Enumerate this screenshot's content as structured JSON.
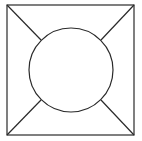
{
  "diagram": {
    "stroke_color": "#2a2a2a",
    "background": "#ffffff",
    "square": {
      "x": 7,
      "y": 5,
      "width": 127,
      "height": 130
    },
    "circle": {
      "cx": 71,
      "cy": 70,
      "r": 42
    },
    "diagonals": [
      {
        "from": [
          7,
          5
        ],
        "to": [
          41,
          40
        ]
      },
      {
        "from": [
          134,
          5
        ],
        "to": [
          101,
          40
        ]
      },
      {
        "from": [
          7,
          135
        ],
        "to": [
          41,
          100
        ]
      },
      {
        "from": [
          134,
          135
        ],
        "to": [
          101,
          100
        ]
      }
    ]
  }
}
